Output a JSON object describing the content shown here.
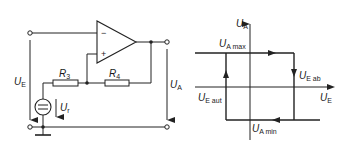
{
  "circuit": {
    "title": "Schmitt trigger (non-inverting feedback) circuit",
    "opamp": {
      "minus_label": "−",
      "plus_label": "+"
    },
    "resistors": [
      {
        "id": "R3",
        "label": "R",
        "sub": "3"
      },
      {
        "id": "R4",
        "label": "R",
        "sub": "4"
      }
    ],
    "source": {
      "label": "U",
      "sub": "r"
    },
    "input_voltage": {
      "label": "U",
      "sub": "E"
    },
    "output_voltage": {
      "label": "U",
      "sub": "A"
    }
  },
  "graph": {
    "type": "hysteresis",
    "y_axis": {
      "label": "U",
      "sub": "A"
    },
    "x_axis": {
      "label": "U",
      "sub": "E"
    },
    "levels": {
      "max": {
        "label": "U",
        "sub": "A max"
      },
      "min": {
        "label": "U",
        "sub": "A min"
      }
    },
    "thresholds": {
      "off": {
        "label": "U",
        "sub": "E ab"
      },
      "on": {
        "label": "U",
        "sub": "E aut"
      }
    },
    "colors": {
      "line": "#222222",
      "background": "#ffffff"
    }
  }
}
